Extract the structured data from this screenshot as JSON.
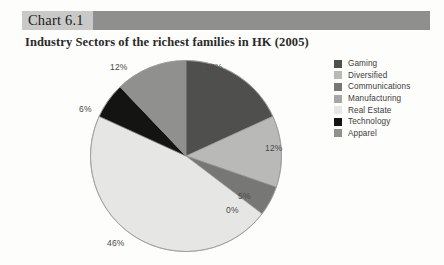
{
  "header": {
    "chart_number": "Chart 6.1",
    "band_color": "#8f8f8d",
    "number_box_color": "#c9c9c7"
  },
  "subtitle": "Industry Sectors of the richest families in HK (2005)",
  "legend": {
    "position": "right",
    "items": [
      {
        "label": "Gaming",
        "color": "#4f4f4d"
      },
      {
        "label": "Diversified",
        "color": "#b9b9b7"
      },
      {
        "label": "Communications",
        "color": "#777775"
      },
      {
        "label": "Manufacturing",
        "color": "#a6a6a4"
      },
      {
        "label": "Real Estate",
        "color": "#e6e6e4"
      },
      {
        "label": "Technology",
        "color": "#141412"
      },
      {
        "label": "Apparel",
        "color": "#90908e"
      }
    ]
  },
  "chart_data": {
    "type": "pie",
    "title": "Industry Sectors of the richest families in HK (2005)",
    "categories": [
      "Gaming",
      "Diversified",
      "Communications",
      "Manufacturing",
      "Real Estate",
      "Technology",
      "Apparel"
    ],
    "values": [
      18,
      12,
      5,
      0,
      46,
      6,
      12
    ],
    "value_labels": [
      "18%",
      "12%",
      "5%",
      "0%",
      "46%",
      "6%",
      "12%"
    ],
    "colors": [
      "#4f4f4d",
      "#b9b9b7",
      "#777775",
      "#a6a6a4",
      "#e6e6e4",
      "#141412",
      "#90908e"
    ],
    "unit": "percent",
    "legend_position": "right",
    "grid": false,
    "start_angle_deg": -90,
    "direction": "clockwise"
  },
  "slice_labels": {
    "gaming": "18%",
    "diversified": "12%",
    "communications": "5%",
    "manufacturing": "0%",
    "real_estate": "46%",
    "technology": "6%",
    "apparel": "12%"
  }
}
